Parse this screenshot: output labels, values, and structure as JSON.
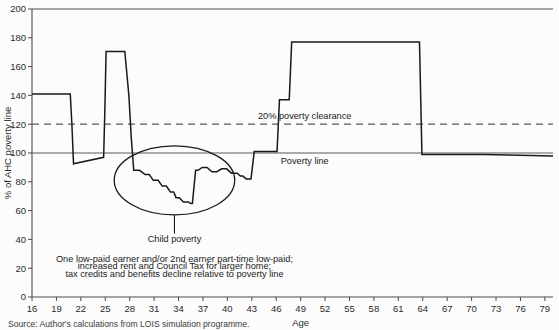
{
  "figure": {
    "source_note": "Source: Author's calculations from LOIS simulation programme.",
    "background_color": "#fcfcfc",
    "line_color": "#1a1a1a",
    "axis_color": "#4a4a4a"
  },
  "labels": {
    "poverty_clearance": "20% poverty clearance",
    "poverty_line": "Poverty line",
    "child_poverty": "Child poverty",
    "annotation_line1": "One low-paid earner and/or 2nd earner part-time low-paid;",
    "annotation_line2": "increased rent and Council Tax for larger home;",
    "annotation_line3": "tax credits and benefits decline relative to poverty line"
  },
  "chart_data": {
    "type": "line",
    "title": "",
    "xlabel": "Age",
    "ylabel": "% of AHC poverty line",
    "xlim": [
      16,
      80
    ],
    "ylim": [
      0,
      200
    ],
    "grid": false,
    "legend_position": "none",
    "xticks": [
      16,
      19,
      22,
      25,
      28,
      31,
      34,
      37,
      40,
      43,
      46,
      49,
      52,
      55,
      58,
      61,
      64,
      67,
      70,
      73,
      76,
      79
    ],
    "yticks": [
      0,
      20,
      40,
      60,
      80,
      100,
      120,
      140,
      160,
      180,
      200
    ],
    "reference_lines": [
      {
        "name": "poverty-line",
        "y": 100,
        "style": "solid",
        "label": "Poverty line"
      },
      {
        "name": "poverty-clearance-line",
        "y": 120,
        "style": "dashed",
        "label": "20% poverty clearance"
      }
    ],
    "annotations": [
      {
        "name": "child-poverty-ellipse",
        "type": "ellipse",
        "cx": 33.5,
        "cy": 81,
        "rx": 7.4,
        "ry": 24
      },
      {
        "name": "child-poverty-leader",
        "type": "line",
        "x": 33.5,
        "y1": 57,
        "y2": 44
      },
      {
        "name": "child-poverty-text",
        "type": "text",
        "x": 33.5,
        "y": 38,
        "text": "Child poverty"
      }
    ],
    "series": [
      {
        "name": "Net income as % of AHC poverty line",
        "x": [
          16,
          20.7,
          20.9,
          21.1,
          24.8,
          24.95,
          25.1,
          27.4,
          27.9,
          28.2,
          28.5,
          29.2,
          29.9,
          30.4,
          30.9,
          31.5,
          32.0,
          32.5,
          33.0,
          33.4,
          33.7,
          34.1,
          34.6,
          35.2,
          35.5,
          35.7,
          36.1,
          36.4,
          36.9,
          37.5,
          38.1,
          38.7,
          39.3,
          39.9,
          40.5,
          41.2,
          41.6,
          41.9,
          42.3,
          42.9,
          43.3,
          43.6,
          43.9,
          46.1,
          46.4,
          47.6,
          47.9,
          63.6,
          63.9,
          71.5,
          80
        ],
        "values": [
          141,
          141,
          120,
          92.5,
          97,
          130,
          170.5,
          170.5,
          140,
          110,
          88,
          88,
          85,
          85,
          81,
          81,
          77,
          77,
          73,
          73,
          69,
          69,
          66,
          66,
          65,
          65,
          88,
          88,
          90,
          90,
          87,
          87,
          89,
          89,
          86,
          86,
          84,
          84,
          82,
          82,
          101,
          101,
          101,
          101,
          137,
          137,
          177,
          177,
          99,
          99,
          98
        ]
      }
    ]
  }
}
